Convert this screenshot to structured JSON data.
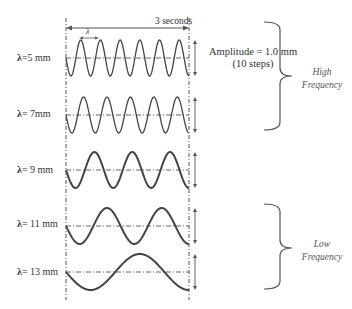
{
  "title_duration": "3 seconds",
  "lambda_marker": "λ",
  "amplitude": {
    "line1": "Amplitude = 1.0 mm",
    "line2": "(10 steps)"
  },
  "groups": {
    "high": {
      "line1": "High",
      "line2": "Frequency"
    },
    "low": {
      "line1": "Low",
      "line2": "Frequency"
    }
  },
  "waves": [
    {
      "symbol": "λ",
      "label": "=5 mm",
      "wavelength_mm": 5,
      "cycles": 6,
      "center_y": 58
    },
    {
      "symbol": "λ",
      "label": "= 7mm",
      "wavelength_mm": 7,
      "cycles": 5,
      "center_y": 115
    },
    {
      "symbol": "λ",
      "label": "= 9 mm",
      "wavelength_mm": 9,
      "cycles": 3,
      "center_y": 170
    },
    {
      "symbol": "λ",
      "label": "= 11 mm",
      "wavelength_mm": 11,
      "cycles": 2,
      "center_y": 226
    },
    {
      "symbol": "λ",
      "label": "= 13 mm",
      "wavelength_mm": 13,
      "cycles": 1,
      "center_y": 272
    }
  ],
  "colors": {
    "wave": "#444444",
    "guide": "#555555",
    "text": "#333333"
  }
}
